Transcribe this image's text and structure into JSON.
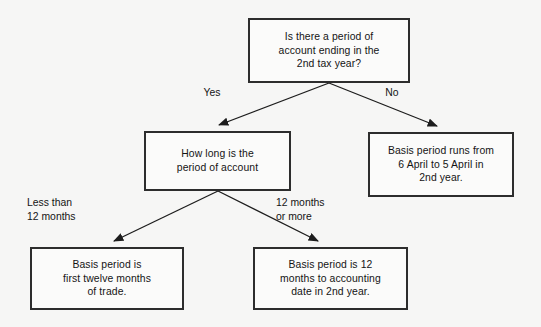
{
  "diagram": {
    "title_alt": "Basis period decision flowchart",
    "background_color": "#f6f6f5",
    "border_color": "#2d2d2d",
    "text_color": "#141414",
    "nodes": {
      "root": "Is there a period of\naccount ending in the\n2nd tax year?",
      "how_long": "How long is the\nperiod of account",
      "no_result": "Basis period runs from\n6 April to 5 April in\n2nd year.",
      "less_than_result": "Basis period is\nfirst twelve months\nof trade.",
      "twelve_or_more_result": "Basis period is 12\nmonths to accounting\ndate in 2nd year."
    },
    "edge_labels": {
      "yes": "Yes",
      "no": "No",
      "less_than_12": "Less than\n12 months",
      "twelve_or_more": "12 months\nor more"
    }
  }
}
